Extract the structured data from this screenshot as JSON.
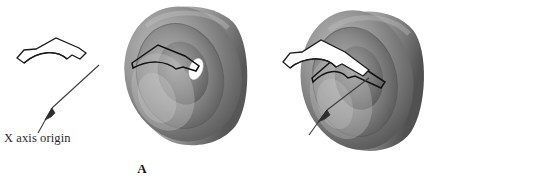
{
  "figure": {
    "background_color": "#ffffff",
    "width": 538,
    "height": 180,
    "caption_font": "serif"
  },
  "panels": [
    {
      "id": "A",
      "label": "A",
      "annotation_text": "X axis origin",
      "profile": {
        "name": "sweep-profile-outline",
        "description": "closed chevron shaped 2D sweep profile outline",
        "stroke_color": "#1a1a1a",
        "fill_color": "#ffffff"
      },
      "leader": {
        "name": "x-axis-origin-leader",
        "stroke_color": "#3a3a3a",
        "arrowhead": "up-right"
      },
      "solid": {
        "name": "wheel-solid-a",
        "description": "3D shaded revolved wheel with grooved rim",
        "light_gray": "#b4b4b4",
        "mid_gray": "#7d7d7d",
        "dark_gray": "#4b4b4b",
        "highlight": "#ffffff",
        "has_white_slot": true
      }
    },
    {
      "id": "B",
      "label": "B",
      "annotation_text": "X axis origin",
      "profile": {
        "name": "sweep-profile-outline",
        "description": "closed chevron shaped 2D sweep profile outline with extended right arm",
        "stroke_color": "#1a1a1a",
        "fill_color": "#ffffff"
      },
      "leader": {
        "name": "x-axis-origin-leader",
        "stroke_color": "#3a3a3a",
        "arrowhead": "up-right"
      },
      "solid": {
        "name": "wheel-solid-b",
        "description": "3D shaded revolved wheel rotated, grooved rim",
        "light_gray": "#adadad",
        "mid_gray": "#787878",
        "dark_gray": "#474747",
        "highlight": "#ffffff",
        "has_white_slot": false
      }
    }
  ]
}
